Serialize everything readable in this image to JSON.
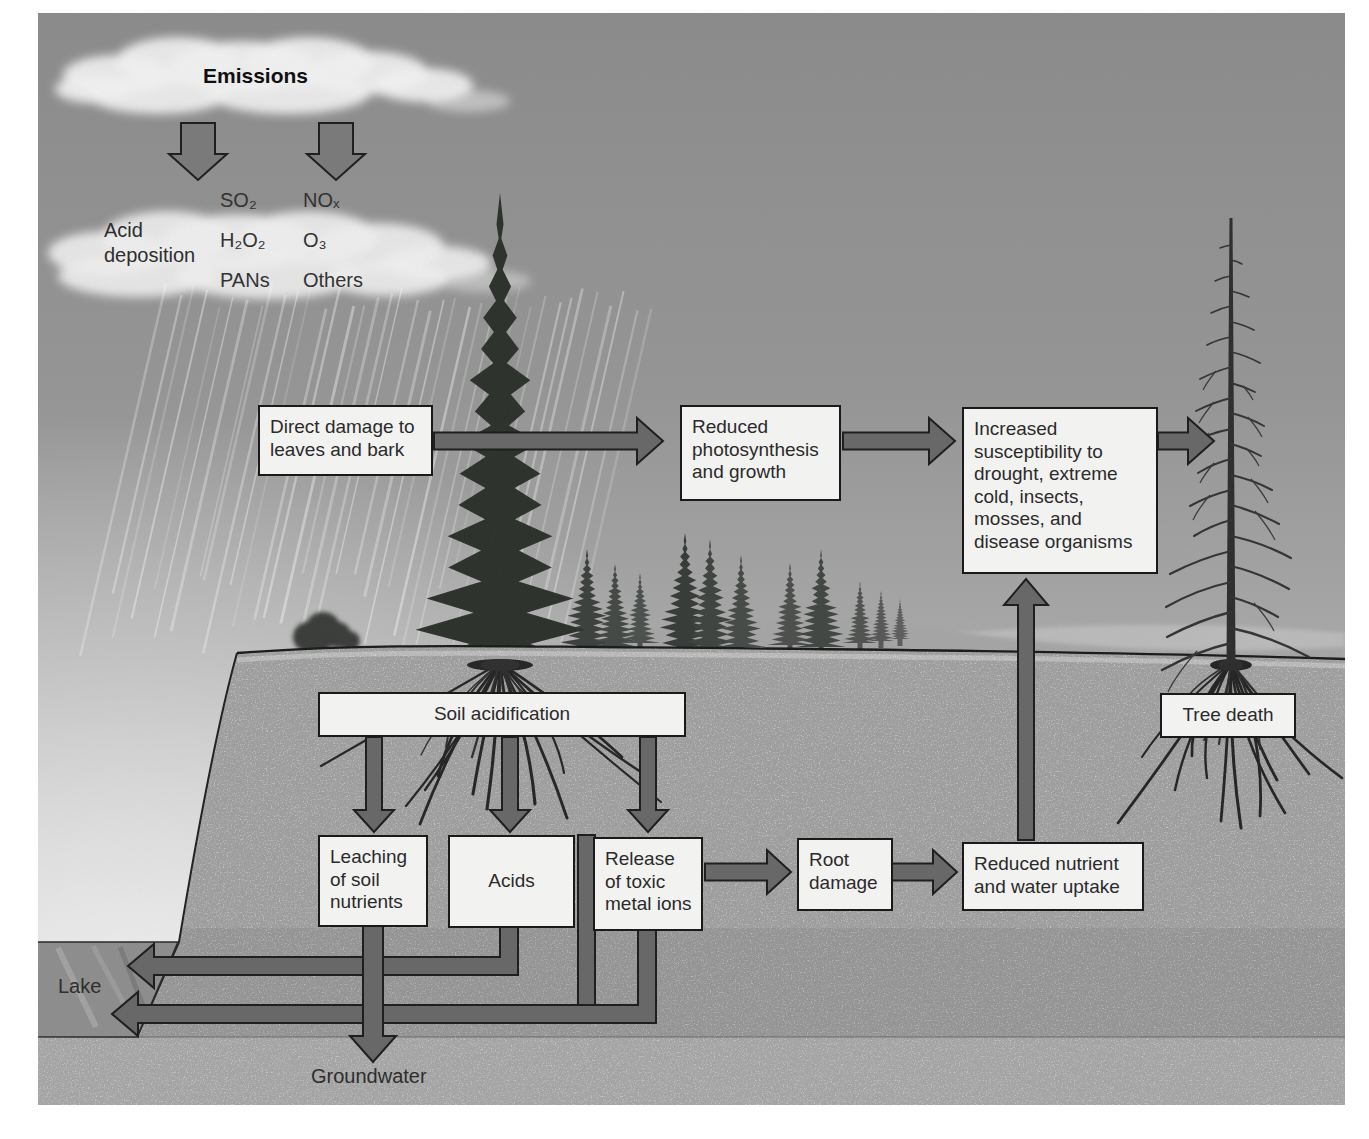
{
  "clouds": {
    "emissions": "Emissions",
    "acid_deposition_line1": "Acid",
    "acid_deposition_line2": "deposition",
    "pollutants_col1": [
      "SO₂",
      "H₂O₂",
      "PANs"
    ],
    "pollutants_col2": [
      "NOₓ",
      "O₃",
      "Others"
    ]
  },
  "boxes": {
    "direct_damage": "Direct damage to leaves and bark",
    "reduced_photosynthesis": "Reduced photosynthesis and growth",
    "increased_susceptibility": "Increased susceptibility to drought, extreme cold, insects, mosses, and disease organisms",
    "soil_acidification": "Soil acidification",
    "leaching": "Leaching of soil nutrients",
    "acids": "Acids",
    "release_toxic": "Release of toxic metal ions",
    "root_damage": "Root damage",
    "reduced_nutrient": "Reduced nutrient and water uptake",
    "tree_death": "Tree death"
  },
  "ground_labels": {
    "lake": "Lake",
    "groundwater": "Groundwater"
  },
  "colors": {
    "arrow_fill": "#686868",
    "arrow_fill_light": "#7a7a7a",
    "arrow_outline": "#1f1f1f",
    "box_bg": "#f2f2f1",
    "box_border": "#1a1a1a",
    "soil": "#9e9e9e",
    "lake": "#8c8c8c",
    "sky_top": "#8b8b8b",
    "sky_horizon": "#d9d9d9"
  }
}
